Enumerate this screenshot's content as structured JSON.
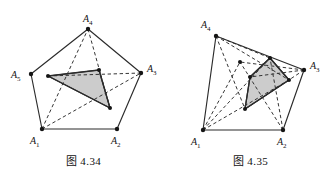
{
  "page": {
    "background_color": "#ffffff",
    "ink_color": "#2b2b2b",
    "shade_color": "#c9c9c9"
  },
  "figures": [
    {
      "id": "figure-4-34",
      "caption": "图 4.34",
      "shape_name": "pentagon",
      "vertices": [
        {
          "name": "A1",
          "label": "A",
          "sub": "1",
          "x": 42,
          "y": 129,
          "label_x": 30,
          "label_y": 144
        },
        {
          "name": "A2",
          "label": "A",
          "sub": "2",
          "x": 117,
          "y": 129,
          "label_x": 111,
          "label_y": 144
        },
        {
          "name": "A3",
          "label": "A",
          "sub": "3",
          "x": 141,
          "y": 73,
          "label_x": 147,
          "label_y": 72
        },
        {
          "name": "A4",
          "label": "A",
          "sub": "4",
          "x": 88,
          "y": 29,
          "label_x": 83,
          "label_y": 22
        },
        {
          "name": "A5",
          "label": "A",
          "sub": "5",
          "x": 31,
          "y": 74,
          "label_x": 11,
          "label_y": 73
        }
      ],
      "outline": "42,129 117,129 141,73 88,29 31,74",
      "diagonals": [
        {
          "from": "A1",
          "to": "A4",
          "path": "M42,129 L88,29"
        },
        {
          "from": "A1",
          "to": "A3",
          "path": "M42,129 L141,73"
        },
        {
          "from": "A4",
          "to": "inner-bottom",
          "path": "M88,29 L110,108"
        },
        {
          "from": "A3",
          "to": "inner-left",
          "path": "M141,73 L48,76"
        }
      ],
      "shaded_polygon": {
        "name": "shaded-triangle",
        "points": "48,76 99,70 110,108",
        "vertices": [
          {
            "x": 48,
            "y": 76
          },
          {
            "x": 99,
            "y": 70
          },
          {
            "x": 110,
            "y": 108
          }
        ]
      }
    },
    {
      "id": "figure-4-35",
      "caption": "图 4.35",
      "shape_name": "quadrilateral",
      "vertices": [
        {
          "name": "A1",
          "label": "A",
          "sub": "1",
          "x": 36,
          "y": 130,
          "label_x": 24,
          "label_y": 145
        },
        {
          "name": "A2",
          "label": "A",
          "sub": "2",
          "x": 116,
          "y": 130,
          "label_x": 110,
          "label_y": 145
        },
        {
          "name": "A3",
          "label": "A",
          "sub": "3",
          "x": 137,
          "y": 70,
          "label_x": 143,
          "label_y": 69
        },
        {
          "name": "A4",
          "label": "A",
          "sub": "4",
          "x": 49,
          "y": 36,
          "label_x": 36,
          "label_y": 28
        }
      ],
      "outline": "36,130 116,130 137,70 49,36",
      "inner_points": [
        {
          "name": "P1",
          "x": 73,
          "y": 62
        },
        {
          "name": "P2",
          "x": 83,
          "y": 77
        },
        {
          "name": "P3",
          "x": 103,
          "y": 58
        },
        {
          "name": "P4",
          "x": 122,
          "y": 80
        },
        {
          "name": "P5",
          "x": 78,
          "y": 109
        }
      ],
      "diagonals": [
        {
          "from": "A4",
          "to": "P4",
          "path": "M49,36 L122,80"
        },
        {
          "from": "A4",
          "to": "P5",
          "path": "M49,36 L78,109"
        },
        {
          "from": "A4",
          "to": "P3",
          "path": "M49,36 L103,58"
        },
        {
          "from": "A1",
          "to": "P3",
          "path": "M36,130 L103,58"
        },
        {
          "from": "A1",
          "to": "P1",
          "path": "M36,130 L73,62"
        },
        {
          "from": "A1",
          "to": "P4",
          "path": "M36,130 L122,80"
        },
        {
          "from": "A2",
          "to": "P1",
          "path": "M116,130 L73,62"
        },
        {
          "from": "A2",
          "to": "P3",
          "path": "M116,130 L103,58"
        },
        {
          "from": "A3",
          "to": "P1",
          "path": "M137,70 L73,62"
        },
        {
          "from": "A3",
          "to": "P2",
          "path": "M137,70 L83,77"
        },
        {
          "from": "A3",
          "to": "P5",
          "path": "M137,70 L78,109"
        }
      ],
      "shaded_polygon": {
        "name": "shaded-quadrilateral",
        "points": "103,58 122,80 78,109 83,77",
        "vertices": [
          {
            "x": 103,
            "y": 58
          },
          {
            "x": 122,
            "y": 80
          },
          {
            "x": 78,
            "y": 109
          },
          {
            "x": 83,
            "y": 77
          }
        ]
      }
    }
  ]
}
